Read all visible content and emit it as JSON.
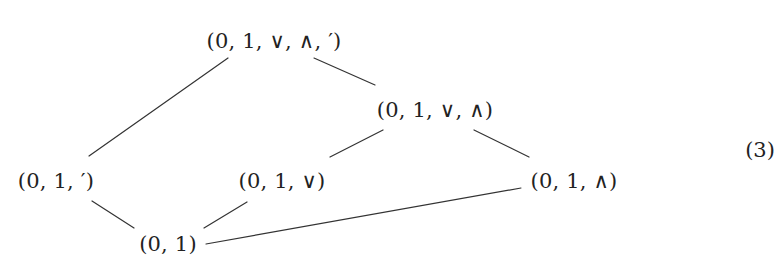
{
  "figure": {
    "type": "hasse-diagram",
    "equation_number": "(3)",
    "nodes": [
      {
        "id": "top",
        "label": "(0, 1, ∨, ∧, ′)",
        "x": 274,
        "y": 41
      },
      {
        "id": "join_meet",
        "label": "(0, 1, ∨, ∧)",
        "x": 435,
        "y": 110
      },
      {
        "id": "complement",
        "label": "(0, 1, ′)",
        "x": 56,
        "y": 181
      },
      {
        "id": "join",
        "label": "(0, 1, ∨)",
        "x": 282,
        "y": 181
      },
      {
        "id": "meet",
        "label": "(0, 1, ∧)",
        "x": 574,
        "y": 181
      },
      {
        "id": "bottom",
        "label": "(0, 1)",
        "x": 168,
        "y": 244
      }
    ],
    "edges": [
      {
        "from": "top",
        "to": "complement",
        "x1": 228,
        "y1": 58,
        "x2": 89,
        "y2": 156
      },
      {
        "from": "top",
        "to": "join_meet",
        "x1": 314,
        "y1": 58,
        "x2": 375,
        "y2": 85
      },
      {
        "from": "join_meet",
        "to": "join",
        "x1": 383,
        "y1": 130,
        "x2": 330,
        "y2": 157
      },
      {
        "from": "join_meet",
        "to": "meet",
        "x1": 474,
        "y1": 130,
        "x2": 529,
        "y2": 157
      },
      {
        "from": "complement",
        "to": "bottom",
        "x1": 92,
        "y1": 201,
        "x2": 134,
        "y2": 228
      },
      {
        "from": "join",
        "to": "bottom",
        "x1": 247,
        "y1": 202,
        "x2": 204,
        "y2": 228
      },
      {
        "from": "bottom",
        "to": "meet",
        "x1": 206,
        "y1": 244,
        "x2": 521,
        "y2": 188
      }
    ]
  }
}
